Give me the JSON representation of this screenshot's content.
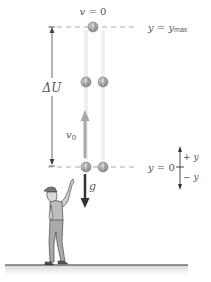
{
  "diagram": {
    "top_level": {
      "velocity_label": "v = 0",
      "position_label_prefix": "y = y",
      "position_label_sub": "max"
    },
    "bottom_level": {
      "position_label": "y = 0"
    },
    "potential_change_label": "ΔU",
    "initial_velocity_label": "v",
    "initial_velocity_sub": "0",
    "gravity_label": "g",
    "axis": {
      "positive_label": "+ y",
      "negative_label": "− y"
    },
    "colors": {
      "dashed_line": "#aaaaaa",
      "ball": "#9a9a9a",
      "velocity_arrow": "#a8a8a8",
      "gravity_arrow": "#333333",
      "ground": "#333333",
      "text": "#555555"
    }
  }
}
